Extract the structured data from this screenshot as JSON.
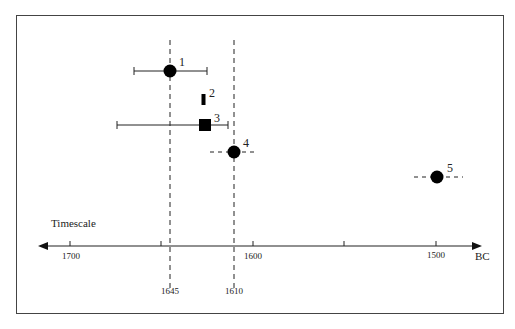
{
  "diagram": {
    "axis_label": "Timescale",
    "unit_label": "BC",
    "axis_direction": "years BC decreasing to the right",
    "ticks": [
      {
        "year": 1700,
        "label": "1700"
      },
      {
        "year": 1650,
        "label": ""
      },
      {
        "year": 1600,
        "label": "1600"
      },
      {
        "year": 1550,
        "label": ""
      },
      {
        "year": 1500,
        "label": "1500"
      }
    ],
    "reference_lines": [
      {
        "year": 1645,
        "label": "1645"
      },
      {
        "year": 1610,
        "label": "1610"
      }
    ],
    "points": [
      {
        "id": "1",
        "label": "1",
        "marker": "circle",
        "year": 1645,
        "range": [
          1665,
          1625
        ],
        "range_style": "solid-capped"
      },
      {
        "id": "2",
        "label": "2",
        "marker": "bar",
        "year": 1627,
        "range": null,
        "range_style": "none"
      },
      {
        "id": "3",
        "label": "3",
        "marker": "square",
        "year": 1626,
        "range": [
          1674,
          1614
        ],
        "range_style": "solid-capped"
      },
      {
        "id": "4",
        "label": "4",
        "marker": "circle",
        "year": 1610,
        "range": [
          1623,
          1597
        ],
        "range_style": "dashed"
      },
      {
        "id": "5",
        "label": "5",
        "marker": "circle",
        "year": 1499,
        "range": [
          1512,
          1485
        ],
        "range_style": "dashed"
      }
    ]
  }
}
